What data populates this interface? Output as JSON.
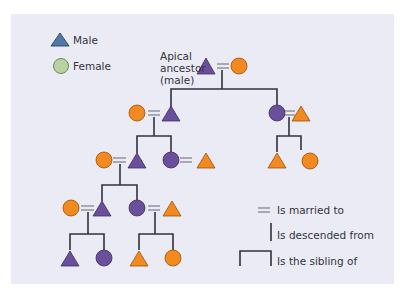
{
  "key": {
    "male_label": "Male",
    "female_label": "Female",
    "male_color": "#4f79a8",
    "female_color": "#b9d3a0"
  },
  "apical_label": {
    "line1": "Apical",
    "line2": "ancestor",
    "line3": "(male)"
  },
  "colors": {
    "background": "#ebebf6",
    "purple": "#6a4f9c",
    "orange": "#f28a1f",
    "line": "#333340"
  },
  "legend": {
    "married": "Is married to",
    "descended": "Is descended from",
    "sibling": "Is the sibling of"
  },
  "individuals": [
    {
      "id": "apical-ancestor",
      "sex": "male",
      "color": "purple",
      "generation": 1
    },
    {
      "id": "apical-spouse",
      "sex": "female",
      "color": "orange",
      "generation": 1
    },
    {
      "id": "g2-left-spouse",
      "sex": "female",
      "color": "orange",
      "generation": 2
    },
    {
      "id": "g2-left-son",
      "sex": "male",
      "color": "purple",
      "generation": 2
    },
    {
      "id": "g2-right-daughter",
      "sex": "female",
      "color": "purple",
      "generation": 2
    },
    {
      "id": "g2-right-spouse",
      "sex": "male",
      "color": "orange",
      "generation": 2
    },
    {
      "id": "g3-right-son",
      "sex": "male",
      "color": "orange",
      "generation": 3
    },
    {
      "id": "g3-right-daughter",
      "sex": "female",
      "color": "orange",
      "generation": 3
    },
    {
      "id": "g3-left-spouse",
      "sex": "female",
      "color": "orange",
      "generation": 3
    },
    {
      "id": "g3-left-son",
      "sex": "male",
      "color": "purple",
      "generation": 3
    },
    {
      "id": "g3-left-daughter",
      "sex": "female",
      "color": "purple",
      "generation": 3
    },
    {
      "id": "g3-left-daughter-spouse",
      "sex": "male",
      "color": "orange",
      "generation": 3
    },
    {
      "id": "g4-left-spouse",
      "sex": "female",
      "color": "orange",
      "generation": 4
    },
    {
      "id": "g4-left-son",
      "sex": "male",
      "color": "purple",
      "generation": 4
    },
    {
      "id": "g4-daughter",
      "sex": "female",
      "color": "purple",
      "generation": 4
    },
    {
      "id": "g4-daughter-spouse",
      "sex": "male",
      "color": "orange",
      "generation": 4
    },
    {
      "id": "g5-son-a",
      "sex": "male",
      "color": "purple",
      "generation": 5
    },
    {
      "id": "g5-daughter-a",
      "sex": "female",
      "color": "purple",
      "generation": 5
    },
    {
      "id": "g5-son-b",
      "sex": "male",
      "color": "orange",
      "generation": 5
    },
    {
      "id": "g5-daughter-b",
      "sex": "female",
      "color": "orange",
      "generation": 5
    }
  ]
}
